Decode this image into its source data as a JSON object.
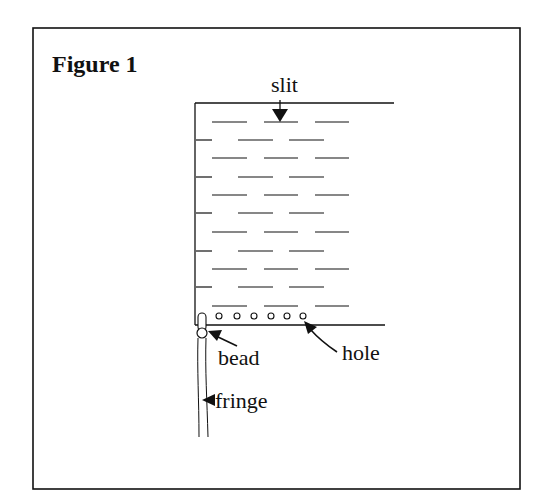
{
  "figure": {
    "title": "Figure 1",
    "labels": {
      "slit": "slit",
      "bead": "bead",
      "hole": "hole",
      "fringe": "fringe"
    },
    "colors": {
      "ink": "#111111",
      "background": "#ffffff"
    },
    "slit_rows": 11,
    "hole_count": 6
  }
}
